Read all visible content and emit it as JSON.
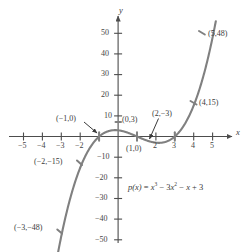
{
  "chart_data": {
    "type": "line",
    "title": "",
    "xlabel": "x",
    "ylabel": "y",
    "equation_latex": "p(x) = x^3 - 3x^2 - x + 3",
    "equation_display": "p(x) = x³ − 3x² − x + 3",
    "xlim": [
      -5.8,
      5.8
    ],
    "ylim": [
      -56,
      56
    ],
    "grid": false,
    "legend": "none",
    "xticks": [
      -5,
      -4,
      -3,
      -2,
      -1,
      1,
      2,
      3,
      4,
      5
    ],
    "xtick_labels": [
      "-5",
      "-4",
      "-3",
      "-2",
      "",
      "",
      "2",
      "3",
      "4",
      "5"
    ],
    "yticks": [
      -50,
      -40,
      -30,
      -20,
      -10,
      10,
      20,
      30,
      40,
      50
    ],
    "ytick_labels": [
      "-50",
      "-40",
      "-30",
      "-20",
      "-10",
      "10",
      "20",
      "30",
      "40",
      "50"
    ],
    "curve_color": "#808080",
    "axis_color": "#4d4d4d",
    "series": [
      {
        "name": "p(x) = x^3 - 3x^2 - x + 3",
        "x": [
          -3.15,
          -3,
          -2.5,
          -2,
          -1.5,
          -1,
          -0.5,
          0,
          0.5,
          1,
          1.5,
          2,
          2.155,
          2.5,
          3,
          3.5,
          4,
          4.5,
          5,
          5.15
        ],
        "y": [
          -55.2,
          -48,
          -28.9,
          -15,
          -5.6,
          0,
          2.6,
          3,
          1.9,
          0,
          -1.9,
          -3,
          -3.1,
          -1.6,
          0,
          5.6,
          15,
          29.4,
          48,
          55.4
        ]
      }
    ],
    "marked_points": [
      {
        "x": -3,
        "y": -48,
        "label": "(−3,−48)",
        "label_side": "left"
      },
      {
        "x": -2,
        "y": -15,
        "label": "(−2,−15)",
        "label_side": "left"
      },
      {
        "x": -1,
        "y": 0,
        "label": "(−1,0)",
        "label_side": "upper-left",
        "has_arrow": true
      },
      {
        "x": 0,
        "y": 3,
        "label": "(0,3)",
        "label_side": "right"
      },
      {
        "x": 1,
        "y": 0,
        "label": "(1,0)",
        "label_side": "below"
      },
      {
        "x": 2,
        "y": -3,
        "label": "(2,−3)",
        "label_side": "upper-right",
        "has_arrow": true
      },
      {
        "x": 3,
        "y": 0,
        "label": "",
        "label_side": "none"
      },
      {
        "x": 4,
        "y": 15,
        "label": "(4,15)",
        "label_side": "right"
      },
      {
        "x": 5,
        "y": 48,
        "label": "(5,48)",
        "label_side": "right"
      }
    ],
    "annotations": [
      {
        "name": "x-axis-label",
        "text": "x"
      },
      {
        "name": "y-axis-label",
        "text": "y"
      }
    ]
  },
  "axis_labels": {
    "x": "x",
    "y": "y"
  },
  "x_ticks": {
    "neg5": "−5",
    "neg4": "−4",
    "neg3": "−3",
    "neg2": "−2",
    "pos2": "2",
    "pos3": "3",
    "pos4": "4",
    "pos5": "5"
  },
  "y_ticks": {
    "pos50": "50",
    "pos40": "40",
    "pos30": "30",
    "pos20": "20",
    "pos10": "10",
    "neg10": "−10",
    "neg20": "−20",
    "neg30": "−30",
    "neg40": "−40",
    "neg50": "−50"
  },
  "point_labels": {
    "p_neg3": "(−3,−48)",
    "p_neg2": "(−2,−15)",
    "p_neg1": "(−1,0)",
    "p_0": "(0,3)",
    "p_1": "(1,0)",
    "p_2": "(2,−3)",
    "p_4": "(4,15)",
    "p_5": "(5,48)"
  },
  "equation": {
    "lhs": "p(x)",
    "eq": "=",
    "t1_base": "x",
    "t1_exp": "3",
    "op1": "−",
    "t2_coef": "3",
    "t2_base": "x",
    "t2_exp": "2",
    "op2": "−",
    "t3": "x",
    "op3": "+",
    "t4": "3"
  },
  "colors": {
    "curve": "#808080",
    "axis": "#4d4d4d",
    "text": "#3a3a3a",
    "background": "#ffffff"
  }
}
